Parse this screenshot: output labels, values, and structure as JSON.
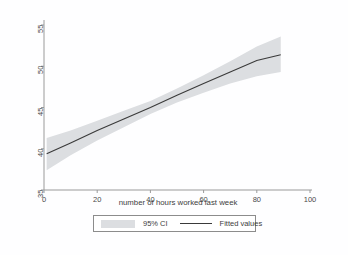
{
  "chart_data": {
    "type": "line",
    "title": "",
    "subtitle": "",
    "xlabel": "number of hours worked last week",
    "ylabel": "",
    "xlim": [
      0,
      100
    ],
    "ylim": [
      35,
      55
    ],
    "xticks": [
      0,
      20,
      40,
      60,
      80,
      100
    ],
    "yticks": [
      35,
      40,
      45,
      50,
      55
    ],
    "xtick_labels": [
      "0",
      "20",
      "40",
      "60",
      "80",
      "100"
    ],
    "ytick_labels": [
      "35",
      "40",
      "45",
      "50",
      "55"
    ],
    "grid": false,
    "legend_position": "below-axis",
    "series": [
      {
        "name": "Fitted values",
        "type": "line",
        "color": "#3a3a3a",
        "x": [
          1,
          10,
          20,
          30,
          40,
          50,
          60,
          70,
          80,
          89
        ],
        "values": [
          39.4,
          40.7,
          42.2,
          43.6,
          45.0,
          46.5,
          47.9,
          49.3,
          50.7,
          51.4
        ]
      },
      {
        "name": "95% CI",
        "type": "band",
        "color": "#dcdee1",
        "x": [
          1,
          10,
          20,
          30,
          40,
          50,
          60,
          70,
          80,
          89
        ],
        "lower": [
          37.4,
          39.2,
          41.0,
          42.6,
          44.2,
          45.6,
          46.8,
          47.9,
          48.8,
          49.3
        ],
        "upper": [
          41.3,
          42.2,
          43.4,
          44.6,
          45.8,
          47.3,
          48.9,
          50.6,
          52.4,
          53.6
        ]
      }
    ],
    "annotations": []
  },
  "legend": {
    "entries": [
      {
        "label": "95% CI",
        "marker": "band-swatch",
        "color": "#dcdee1"
      },
      {
        "label": "Fitted values",
        "marker": "line-swatch",
        "color": "#3a3a3a"
      }
    ]
  },
  "axes": {
    "x_title": "number of hours worked last week",
    "y_title": ""
  },
  "colors": {
    "background": "#fefeff",
    "axis": "#9a9a9a",
    "fit_line": "#3a3a3a",
    "ci_band": "#dcdee1",
    "text": "#3d3d3d"
  }
}
